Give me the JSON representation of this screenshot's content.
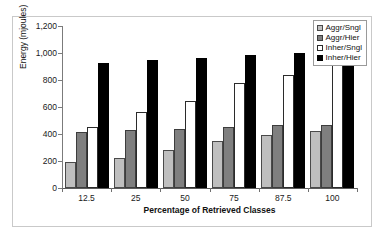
{
  "chart_data": {
    "type": "bar",
    "title": "",
    "subtitle": "",
    "xlabel": "Percentage of Retrieved Classes",
    "ylabel": "Energy (mjoules)",
    "categories": [
      "12.5",
      "25",
      "50",
      "75",
      "87.5",
      "100"
    ],
    "series": [
      {
        "name": "Aggr/Sngl",
        "color": "#bfbfbf",
        "values": [
          190,
          225,
          285,
          345,
          390,
          420
        ]
      },
      {
        "name": "Aggr/Hier",
        "color": "#7f7f7f",
        "values": [
          415,
          430,
          440,
          455,
          465,
          470
        ]
      },
      {
        "name": "Inher/Sngl",
        "color": "#ffffff",
        "values": [
          450,
          560,
          645,
          775,
          840,
          925
        ]
      },
      {
        "name": "Inher/Hier",
        "color": "#000000",
        "values": [
          925,
          945,
          960,
          985,
          1000,
          1030
        ]
      }
    ],
    "ylim": [
      0,
      1200
    ],
    "yticks": [
      0,
      200,
      400,
      600,
      800,
      1000,
      1200
    ],
    "ytick_labels": [
      "0",
      "200",
      "400",
      "600",
      "800",
      "1,000",
      "1,200"
    ],
    "grid": false,
    "legend_position": "top-right"
  }
}
